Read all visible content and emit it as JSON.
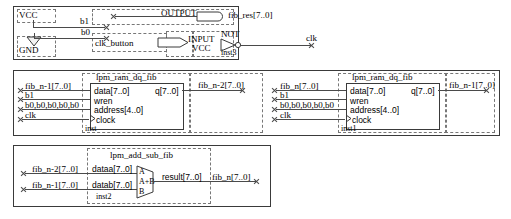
{
  "diagram": {
    "groups": [
      {
        "id": "group-top",
        "nodes": {
          "vcc_label": "VCC",
          "gnd_label": "GND",
          "b1": "b1",
          "b0": "b0",
          "output_pin": "OUTPUT",
          "fib_res": "fib_res[7..0]",
          "clk_button": "clk_button",
          "input_pin": "INPUT",
          "input_pin_sub": "VCC",
          "not_gate": "NOT",
          "not_inst": "inst3",
          "clk_out": "clk"
        }
      },
      {
        "id": "group-ram-left",
        "block_title": "lpm_ram_dq_fib",
        "inst": "inst",
        "inputs": [
          "fib_n-1[7..0]",
          "b1",
          "b0,b0,b0,b0,b0",
          "clk"
        ],
        "ports_in": [
          "data[7..0]",
          "wren",
          "address[4..0]",
          "clock"
        ],
        "port_out": "q[7..0]",
        "output_net": "fib_n-2[7..0]"
      },
      {
        "id": "group-ram-right",
        "block_title": "lpm_ram_dq_fib",
        "inst": "inst1",
        "inputs": [
          "fib_n[7..0]",
          "b1",
          "b0,b0,b0,b0,b0",
          "clk"
        ],
        "ports_in": [
          "data[7..0]",
          "wren",
          "address[4..0]",
          "clock"
        ],
        "port_out": "q[7..0]",
        "output_net": "fib_n-1[7..0]"
      },
      {
        "id": "group-adder",
        "block_title": "lpm_add_sub_fib",
        "inst": "inst2",
        "inputs": [
          "fib_n-2[7..0]",
          "fib_n-1[7..0]"
        ],
        "ports_in": [
          "dataa[7..0]",
          "datab[7..0]"
        ],
        "symbol_labels": [
          "A",
          "A+B",
          "B"
        ],
        "port_out": "result[7..0]",
        "output_net": "fib_n[7..0]"
      }
    ],
    "colors": {
      "wire": "#4a4a4a",
      "frame": "#3a3a3a",
      "dashed": "#777777",
      "background": "#ffffff",
      "text": "#000000"
    }
  }
}
